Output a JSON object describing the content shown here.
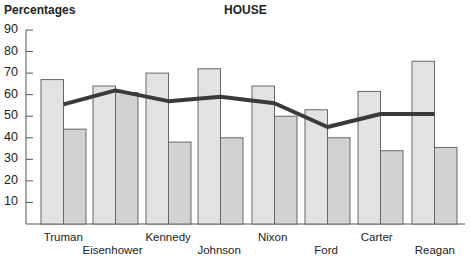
{
  "chart_data": {
    "type": "bar+line",
    "title": "HOUSE",
    "ylabel": "Percentages",
    "xlabel": "",
    "ylim": [
      0,
      90
    ],
    "yticks": [
      10,
      20,
      30,
      40,
      50,
      60,
      70,
      80,
      90
    ],
    "categories": [
      "Truman",
      "Eisenhower",
      "Kennedy",
      "Johnson",
      "Nixon",
      "Ford",
      "Carter",
      "Reagan"
    ],
    "series": [
      {
        "name": "Light bar",
        "type": "bar",
        "color": "#e2e2e2",
        "values": [
          67,
          64,
          70,
          72,
          64,
          53,
          61.5,
          75.5
        ]
      },
      {
        "name": "Dark bar",
        "type": "bar",
        "color": "#d2d2d2",
        "values": [
          44,
          61,
          38,
          40,
          50,
          40,
          34,
          35.5
        ]
      },
      {
        "name": "Line",
        "type": "line",
        "color": "#3a3a3a",
        "values": [
          55.5,
          62,
          57,
          59,
          56,
          45,
          51,
          51
        ]
      }
    ],
    "grid": false,
    "legend": null
  }
}
